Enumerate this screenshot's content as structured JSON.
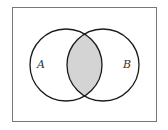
{
  "diagram": {
    "type": "venn",
    "sets": [
      {
        "label": "A"
      },
      {
        "label": "B"
      }
    ],
    "shaded_region": "A ∩ B",
    "colors": {
      "shade": "#d4d4d4",
      "stroke": "#1a1a1a",
      "frame": "#777777"
    }
  }
}
